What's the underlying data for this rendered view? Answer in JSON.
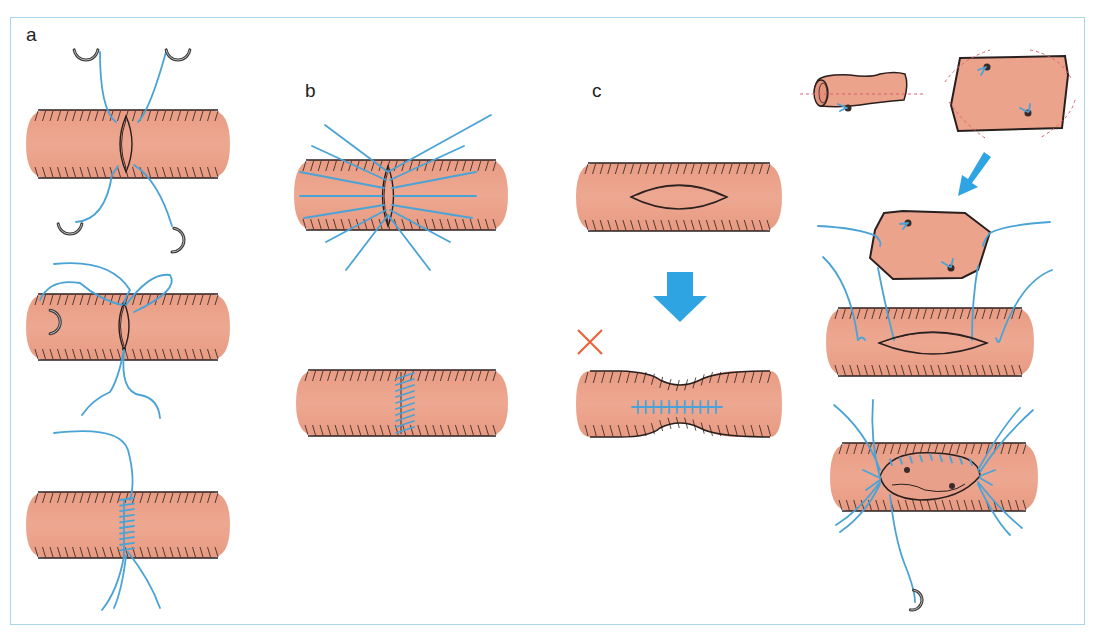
{
  "figure": {
    "panels": [
      {
        "id": "a",
        "label": "a",
        "description": "Interrupted/continuous suture of a longitudinal incision with double-armed needles",
        "steps": 3
      },
      {
        "id": "b",
        "label": "b",
        "description": "Transverse closure with multiple stay sutures",
        "steps": 2
      },
      {
        "id": "c",
        "label": "c",
        "description": "Primary longitudinal closure causing stenosis (incorrect)",
        "steps": 2,
        "marker": "incorrect"
      },
      {
        "id": "d",
        "label": "",
        "description": "Vein patch angioplasty: harvested vein opened, trimmed and sewn over elliptical arteriotomy",
        "steps": 4
      }
    ],
    "markers": {
      "incorrect_symbol": "×"
    },
    "colors": {
      "tissue": "#eba38b",
      "outline": "#2a1f1f",
      "suture": "#4aa3d6",
      "arrow": "#2ea4e2",
      "incorrect": "#e8653b",
      "frame": "#a9d6e8",
      "needle": "#555555",
      "cut_line": "#e06070"
    }
  }
}
